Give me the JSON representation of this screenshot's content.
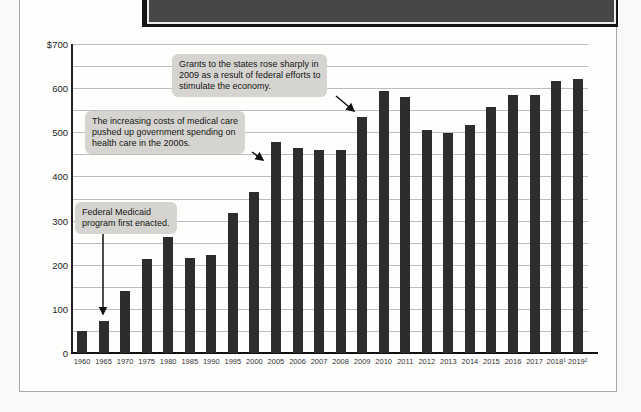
{
  "figure": {
    "panel_border_color": "#a8a8a8",
    "banner_fill_color": "#474747",
    "banner_edge_color": "#141414",
    "banner_inner_line_color": "#ececec"
  },
  "chart_data": {
    "type": "bar",
    "title": "",
    "xlabel": "",
    "ylabel": "",
    "categories": [
      "1960",
      "1965",
      "1970",
      "1975",
      "1980",
      "1985",
      "1990",
      "1995",
      "2000",
      "2005",
      "2006",
      "2007",
      "2008",
      "2009",
      "2010",
      "2011",
      "2012",
      "2013",
      "2014",
      "2015",
      "2016",
      "2017",
      "2018¹",
      "2019²"
    ],
    "values": [
      49,
      72,
      140,
      214,
      263,
      215,
      222,
      318,
      365,
      477,
      465,
      460,
      460,
      535,
      594,
      579,
      505,
      499,
      517,
      557,
      585,
      584,
      616,
      621
    ],
    "y_axis": {
      "min": 0,
      "max": 700,
      "major_step": 100,
      "minor_gridline_step": 50,
      "top_label": "$700",
      "unit_prefix": "$"
    },
    "grid": "horizontal",
    "legend": "none",
    "bar_color": "#2d2d2d",
    "gridline_color": "#bdbdbd",
    "annotations": [
      {
        "id": "stimulus-2009",
        "text": "Grants to the states rose sharply in\n2009 as a result of federal efforts to\nstimulate the economy.",
        "target_year": "2009"
      },
      {
        "id": "medical-costs-2000s",
        "text": "The increasing costs of medical care\npushed up government spending on\nhealth care in the 2000s.",
        "target_year": "2005"
      },
      {
        "id": "medicaid-enacted",
        "text": "Federal Medicaid\nprogram first enacted.",
        "target_year": "1965"
      }
    ]
  }
}
